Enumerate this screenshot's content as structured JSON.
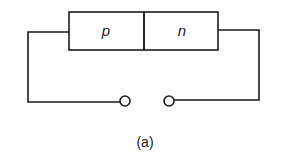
{
  "diagram": {
    "type": "pn-junction-open-circuit",
    "regions": [
      {
        "label": "p"
      },
      {
        "label": "n"
      }
    ],
    "terminals": [
      "left-terminal",
      "right-terminal"
    ],
    "caption": "(a)",
    "colors": {
      "stroke": "#1a1a1a",
      "background": "#ffffff"
    }
  }
}
